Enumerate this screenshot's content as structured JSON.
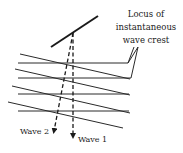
{
  "diagram": {
    "annotation": {
      "lines": [
        "Locus of",
        "instantaneous",
        "wave crest"
      ]
    },
    "waves": [
      {
        "label": "Wave 1",
        "style": "dashed"
      },
      {
        "label": "Wave 2",
        "style": "dashed"
      }
    ],
    "colors": {
      "ink": "#1a1a1a",
      "background": "#ffffff"
    }
  }
}
